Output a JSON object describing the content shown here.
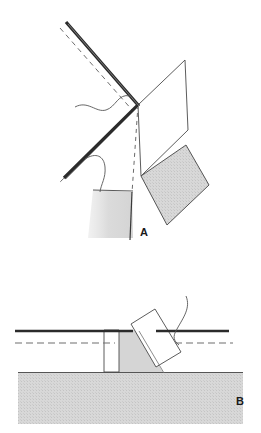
{
  "figure": {
    "title_text": "",
    "panels": [
      {
        "id": "A",
        "label": "A",
        "label_x": 140,
        "label_y": 227,
        "description": "Oblique three-dimensional block diagram of a chevron-shaped folded surface with a vertical white plane and two shaded gray planes, with a thick dark line and parallel dashed line marking a hinge or fold axis."
      },
      {
        "id": "B",
        "label": "B",
        "label_x": 236,
        "label_y": 396,
        "description": "Cross-section view showing a horizontal ground surface with gray hatched fill, a vertical white slab and a tilted white slab inclined to the right, crossed by a solid horizontal line and a parallel dashed horizontal line."
      }
    ]
  },
  "colors": {
    "background": "#ffffff",
    "line_dark": "#2b2b2b",
    "line_thin": "#4a4a4a",
    "fill_gray": "#d3d3d3",
    "fill_gray_light": "#dcdcdc",
    "fill_white": "#ffffff",
    "label_color": "#1a1a1a"
  },
  "panel_a": {
    "thick_fold_line": {
      "name": "fold-axis-thick-line",
      "points": "66,22 138,105 64,178",
      "stroke_width": 3.2
    },
    "dashed_fold_line": {
      "name": "fold-axis-dashed-line",
      "points": "60,28 132,111 58,184",
      "dash": "5,4"
    },
    "vertical_dashed_line": {
      "name": "vertical-hinge-dashed-line",
      "points": "138,105 131,192",
      "dash": "4,4"
    },
    "white_plane": {
      "name": "white-plane-upper-right",
      "points": "138,105 185,60 188,130 141,176"
    },
    "gray_plane_right": {
      "name": "gray-plane-right",
      "points": "141,176 186,145 209,185 167,225"
    },
    "gray_plane_left": {
      "name": "gray-plane-left",
      "points": "131,192 94,191 90,235 132,236"
    },
    "leader_upper": {
      "name": "leader-line-upper-squiggle",
      "path": "M 75,107 C 88,100 96,113 106,110 C 116,107 118,93 130,96"
    },
    "leader_lower": {
      "name": "leader-line-lower-hook",
      "path": "M 85,159 C 95,153 103,155 104,166 C 105,177 101,184 100,191"
    }
  },
  "panel_b": {
    "ground": {
      "name": "ground-hatched-block",
      "points": "18,372 243,372 243,424 18,424",
      "top_y": 372
    },
    "solid_line": {
      "name": "datum-solid-line",
      "points": "16,331 228,331",
      "stroke_width": 2.4
    },
    "dashed_line": {
      "name": "datum-dashed-line",
      "points": "16,343 232,343",
      "dash": "7,4"
    },
    "wedge_gray": {
      "name": "gray-wedge-fill",
      "points": "113,330 135,330 162,372 113,372"
    },
    "vertical_slab": {
      "name": "vertical-white-slab",
      "points": "104,330 119,330 119,372 104,372"
    },
    "tilted_slab": {
      "name": "tilted-white-slab",
      "points": "131,324 154,310 180,352 155,367"
    },
    "leader_right": {
      "name": "leader-line-right-curve",
      "path": "M 185,297 C 190,308 183,318 177,329 C 173,337 174,341 178,345"
    }
  }
}
